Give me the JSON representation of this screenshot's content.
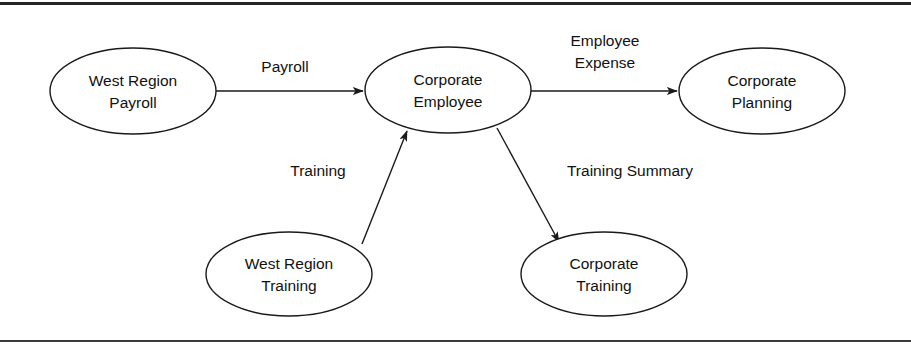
{
  "figure": {
    "background_color": "#ffffff",
    "line_color": "#1a1a1a",
    "text_color": "#111111",
    "frame_color": "#262626"
  },
  "nodes": [
    {
      "id": "west-region-payroll",
      "line1": "West Region",
      "line2": "Payroll",
      "cx": 133,
      "cy": 91,
      "rx": 83,
      "ry": 43
    },
    {
      "id": "corporate-employee",
      "line1": "Corporate",
      "line2": "Employee",
      "cx": 448,
      "cy": 90,
      "rx": 83,
      "ry": 43
    },
    {
      "id": "corporate-planning",
      "line1": "Corporate",
      "line2": "Planning",
      "cx": 762,
      "cy": 91,
      "rx": 83,
      "ry": 43
    },
    {
      "id": "west-region-training",
      "line1": "West Region",
      "line2": "Training",
      "cx": 289,
      "cy": 274,
      "rx": 83,
      "ry": 42
    },
    {
      "id": "corporate-training",
      "line1": "Corporate",
      "line2": "Training",
      "cx": 604,
      "cy": 274,
      "rx": 83,
      "ry": 42
    }
  ],
  "edges": [
    {
      "id": "payroll-flow",
      "label_line1": "Payroll",
      "label_line2": "",
      "from": "west-region-payroll",
      "to": "corporate-employee",
      "label_x": 285,
      "label_y": 68
    },
    {
      "id": "employee-expense-flow",
      "label_line1": "Employee",
      "label_line2": "Expense",
      "from": "corporate-employee",
      "to": "corporate-planning",
      "label_x": 605,
      "label_y": 42
    },
    {
      "id": "training-flow",
      "label_line1": "Training",
      "label_line2": "",
      "from": "west-region-training",
      "to": "corporate-employee",
      "label_x": 318,
      "label_y": 172
    },
    {
      "id": "training-summary-flow",
      "label_line1": "Training Summary",
      "label_line2": "",
      "from": "corporate-employee",
      "to": "corporate-training",
      "label_x": 630,
      "label_y": 172
    }
  ]
}
